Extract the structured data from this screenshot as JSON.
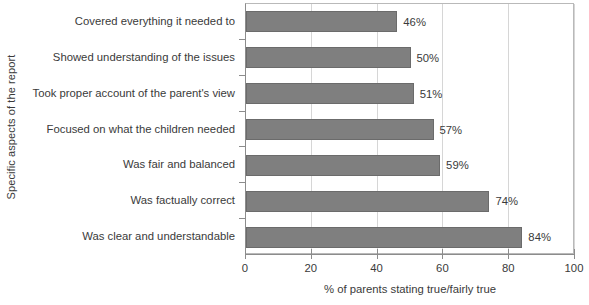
{
  "chart_data": {
    "type": "bar",
    "orientation": "horizontal",
    "title": "",
    "xlabel": "% of parents stating true/fairly true",
    "ylabel": "Specific aspects of the report",
    "categories": [
      "Covered everything it needed to",
      "Showed understanding of the issues",
      "Took proper account of the parent's view",
      "Focused on what the children needed",
      "Was fair and balanced",
      "Was factually correct",
      "Was clear and understandable"
    ],
    "values": [
      46,
      50,
      51,
      57,
      59,
      74,
      84
    ],
    "value_labels": [
      "46%",
      "50%",
      "51%",
      "57%",
      "59%",
      "74%",
      "84%"
    ],
    "xlim": [
      0,
      100
    ],
    "xticks": [
      0,
      20,
      40,
      60,
      80,
      100
    ],
    "xtick_labels": [
      "0",
      "20",
      "40",
      "60",
      "80",
      "100"
    ],
    "grid": "vertical",
    "legend": "none",
    "bar_color": "#7f7f7f",
    "bar_border_color": "#6b6b6b",
    "gridline_color": "#d6d6d6",
    "axis_color": "#8c8c8c",
    "text_color": "#3a3a3a",
    "background": "#ffffff"
  }
}
